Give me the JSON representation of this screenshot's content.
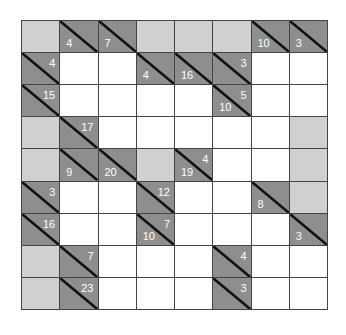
{
  "puzzle": {
    "type": "kakuro",
    "cols": 8,
    "rows": 9,
    "colors": {
      "clue": "#8e8e8e",
      "block": "#d0d0d0",
      "white": "#ffffff",
      "grid_line": "#444444",
      "clue_text": "#ffffff"
    },
    "grid": [
      [
        {
          "t": "block"
        },
        {
          "t": "clue",
          "down": "4"
        },
        {
          "t": "clue",
          "down": "7"
        },
        {
          "t": "block"
        },
        {
          "t": "block"
        },
        {
          "t": "block"
        },
        {
          "t": "clue",
          "down": "10"
        },
        {
          "t": "clue",
          "down": "3"
        }
      ],
      [
        {
          "t": "clue",
          "across": "4"
        },
        {
          "t": "white"
        },
        {
          "t": "white"
        },
        {
          "t": "clue",
          "down": "4"
        },
        {
          "t": "clue",
          "down": "16"
        },
        {
          "t": "clue",
          "across": "3"
        },
        {
          "t": "white"
        },
        {
          "t": "white"
        }
      ],
      [
        {
          "t": "clue",
          "across": "15"
        },
        {
          "t": "white"
        },
        {
          "t": "white"
        },
        {
          "t": "white"
        },
        {
          "t": "white"
        },
        {
          "t": "clue",
          "across": "5",
          "down": "10"
        },
        {
          "t": "white"
        },
        {
          "t": "white"
        }
      ],
      [
        {
          "t": "block"
        },
        {
          "t": "clue",
          "across": "17"
        },
        {
          "t": "white"
        },
        {
          "t": "white"
        },
        {
          "t": "white"
        },
        {
          "t": "white"
        },
        {
          "t": "white"
        },
        {
          "t": "block"
        }
      ],
      [
        {
          "t": "block"
        },
        {
          "t": "clue",
          "down": "9"
        },
        {
          "t": "clue",
          "down": "20"
        },
        {
          "t": "block"
        },
        {
          "t": "clue",
          "across": "4",
          "down": "19"
        },
        {
          "t": "white"
        },
        {
          "t": "white"
        },
        {
          "t": "block"
        }
      ],
      [
        {
          "t": "clue",
          "across": "3"
        },
        {
          "t": "white"
        },
        {
          "t": "white"
        },
        {
          "t": "clue",
          "across": "12"
        },
        {
          "t": "white"
        },
        {
          "t": "white"
        },
        {
          "t": "clue",
          "down": "8"
        },
        {
          "t": "block"
        }
      ],
      [
        {
          "t": "clue",
          "across": "16"
        },
        {
          "t": "white"
        },
        {
          "t": "white"
        },
        {
          "t": "clue",
          "across": "7",
          "down": "10"
        },
        {
          "t": "white"
        },
        {
          "t": "white"
        },
        {
          "t": "white"
        },
        {
          "t": "clue",
          "down": "3"
        }
      ],
      [
        {
          "t": "block"
        },
        {
          "t": "clue",
          "across": "7"
        },
        {
          "t": "white"
        },
        {
          "t": "white"
        },
        {
          "t": "white"
        },
        {
          "t": "clue",
          "across": "4"
        },
        {
          "t": "white"
        },
        {
          "t": "white"
        }
      ],
      [
        {
          "t": "block"
        },
        {
          "t": "clue",
          "across": "23"
        },
        {
          "t": "white"
        },
        {
          "t": "white"
        },
        {
          "t": "white"
        },
        {
          "t": "clue",
          "across": "3"
        },
        {
          "t": "white"
        },
        {
          "t": "white"
        }
      ]
    ]
  }
}
